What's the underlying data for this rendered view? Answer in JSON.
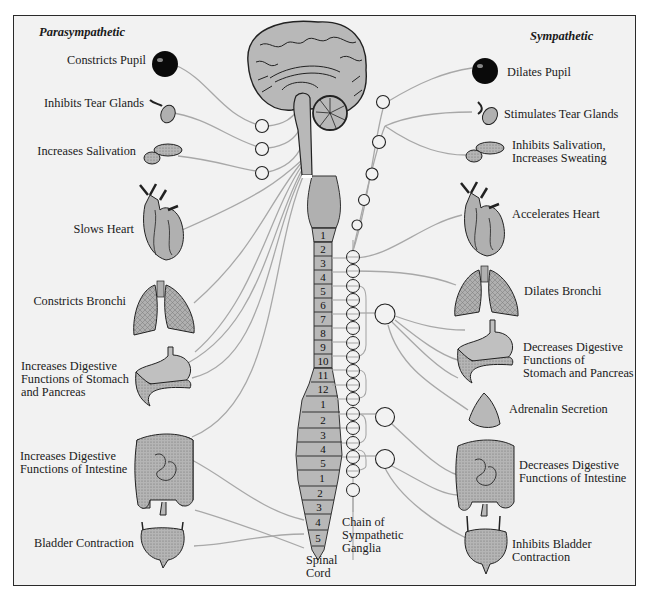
{
  "headers": {
    "left": "Parasympathetic",
    "right": "Sympathetic"
  },
  "parasympathetic": [
    {
      "organ": "eye",
      "label": "Constricts Pupil"
    },
    {
      "organ": "tear-gland",
      "label": "Inhibits Tear Glands"
    },
    {
      "organ": "salivary-gland",
      "label": "Increases Salivation"
    },
    {
      "organ": "heart",
      "label": "Slows Heart"
    },
    {
      "organ": "lungs",
      "label": "Constricts Bronchi"
    },
    {
      "organ": "stomach-pancreas",
      "label_lines": [
        "Increases Digestive",
        "Functions of Stomach",
        "and Pancreas"
      ]
    },
    {
      "organ": "intestine",
      "label_lines": [
        "Increases Digestive",
        "Functions of Intestine"
      ]
    },
    {
      "organ": "bladder",
      "label": "Bladder Contraction"
    }
  ],
  "sympathetic": [
    {
      "organ": "eye",
      "label": "Dilates Pupil"
    },
    {
      "organ": "tear-gland",
      "label": "Stimulates Tear Glands"
    },
    {
      "organ": "salivary-gland",
      "label_lines": [
        "Inhibits Salivation,",
        "Increases Sweating"
      ]
    },
    {
      "organ": "heart",
      "label": "Accelerates Heart"
    },
    {
      "organ": "lungs",
      "label": "Dilates Bronchi"
    },
    {
      "organ": "stomach-pancreas",
      "label_lines": [
        "Decreases Digestive",
        "Functions of",
        "Stomach and Pancreas"
      ]
    },
    {
      "organ": "adrenal-gland",
      "label": "Adrenalin Secretion"
    },
    {
      "organ": "intestine",
      "label_lines": [
        "Decreases Digestive",
        "Functions of Intestine"
      ]
    },
    {
      "organ": "bladder",
      "label_lines": [
        "Inhibits Bladder",
        "Contraction"
      ]
    }
  ],
  "spinal_cord": {
    "label_lines": [
      "Spinal",
      "Cord"
    ],
    "segments": {
      "cervical": [
        "1",
        "2"
      ],
      "thoracic": [
        "3",
        "4",
        "5",
        "6",
        "7",
        "8",
        "9",
        "10",
        "11",
        "12"
      ],
      "lumbar": [
        "1",
        "2",
        "3",
        "4",
        "5"
      ],
      "sacral": [
        "1",
        "2",
        "3",
        "4",
        "5"
      ]
    }
  },
  "ganglia_chain": {
    "label_lines": [
      "Chain of",
      "Sympathetic",
      "Ganglia"
    ]
  },
  "colors": {
    "background": "#f2f2f2",
    "organ_fill": "#b8b8b8",
    "nerve_line": "#a8a8a8",
    "frame": "#2a2a2a"
  }
}
